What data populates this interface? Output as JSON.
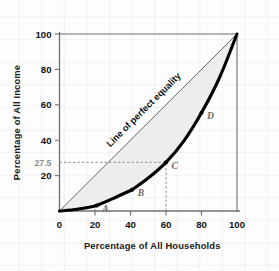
{
  "chart_data": {
    "type": "line",
    "title": "",
    "subtitle": "",
    "xlabel": "Percentage of All Households",
    "ylabel": "Percentage of All Income",
    "xlim": [
      0,
      100
    ],
    "ylim": [
      0,
      100
    ],
    "grid": false,
    "legend_position": "none",
    "x_ticks": [
      0,
      20,
      40,
      60,
      80,
      100
    ],
    "x_tick_labels": [
      "0",
      "20",
      "40",
      "60",
      "80",
      "100"
    ],
    "y_ticks": [
      20,
      40,
      60,
      80,
      100
    ],
    "y_tick_labels": [
      "20",
      "40",
      "60",
      "80",
      "100"
    ],
    "y_extra_ticks": [
      27.5
    ],
    "y_extra_tick_labels": [
      "27.5"
    ],
    "series": [
      {
        "name": "Line of perfect equality",
        "style": "thin-diagonal",
        "x": [
          0,
          100
        ],
        "values": [
          0,
          100
        ]
      },
      {
        "name": "Lorenz curve",
        "style": "thick-curve",
        "x": [
          0,
          10,
          20,
          21,
          30,
          40,
          41,
          50,
          60,
          70,
          80,
          90,
          100
        ],
        "values": [
          0,
          1,
          2.8,
          3.1,
          7,
          11.6,
          12.1,
          18.6,
          27.5,
          39.5,
          55.5,
          75,
          100
        ]
      }
    ],
    "annotations": [
      {
        "name": "A",
        "x": 21,
        "y": 3.1,
        "label": "A"
      },
      {
        "name": "B",
        "x": 41,
        "y": 12.1,
        "label": "B"
      },
      {
        "name": "C",
        "x": 60,
        "y": 27.5,
        "label": "C"
      },
      {
        "name": "D",
        "x": 80,
        "y": 55.5,
        "label": "D"
      }
    ],
    "guides": [
      {
        "name": "c-horizontal-guide",
        "orientation": "horizontal",
        "value": 27.5,
        "from": 0,
        "to": 60,
        "style": "dashed"
      },
      {
        "name": "c-vertical-guide",
        "orientation": "vertical",
        "value": 60,
        "from": 0,
        "to": 27.5,
        "style": "dashed"
      },
      {
        "name": "a-vertical-guide",
        "orientation": "vertical",
        "value": 20,
        "from": 0,
        "to": 3,
        "style": "dashed"
      }
    ],
    "shaded_region": {
      "name": "inequality-gap-area",
      "between": [
        "Line of perfect equality",
        "Lorenz curve"
      ],
      "color": "#eeeeee"
    },
    "colors": {
      "curve": "#000000",
      "equality_line": "#4d4d4d",
      "axis": "#6f6f6f",
      "shade": "#ededed",
      "muted_text": "#8d8d8d",
      "text": "#141414",
      "grid": "#dfe4ec"
    }
  },
  "labels": {
    "equality_line_text": "Line of perfect equality"
  }
}
